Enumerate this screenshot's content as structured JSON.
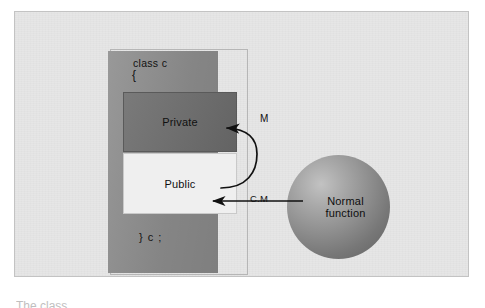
{
  "figure": {
    "caption_sliver": "The class"
  },
  "class_block": {
    "keyword_line": "class c",
    "brace_open": "{",
    "brace_close": "} c ;",
    "sections": [
      {
        "id": "private",
        "label": "Private",
        "fill": "#6d6d6d"
      },
      {
        "id": "public",
        "label": "Public",
        "fill": "#efefef"
      }
    ]
  },
  "sphere": {
    "label_line1": "Normal",
    "label_line2": "function",
    "fill_light": "#c2c2c2",
    "fill_dark": "#636363"
  },
  "arrows": [
    {
      "id": "m-arrow",
      "label": "M",
      "from": "public",
      "to": "private",
      "style": "curved",
      "stroke": "#111111"
    },
    {
      "id": "cm-arrow",
      "label": "C.M",
      "from": "normal-function",
      "to": "public",
      "style": "straight",
      "stroke": "#111111"
    }
  ],
  "colors": {
    "page_background": "#ffffff",
    "frame_background": "#e6e6e6",
    "frame_border": "#c3c3c3",
    "class_box": "#8d8d8d",
    "private_box": "#6d6d6d",
    "public_box": "#efefef",
    "ink": "#111111"
  }
}
